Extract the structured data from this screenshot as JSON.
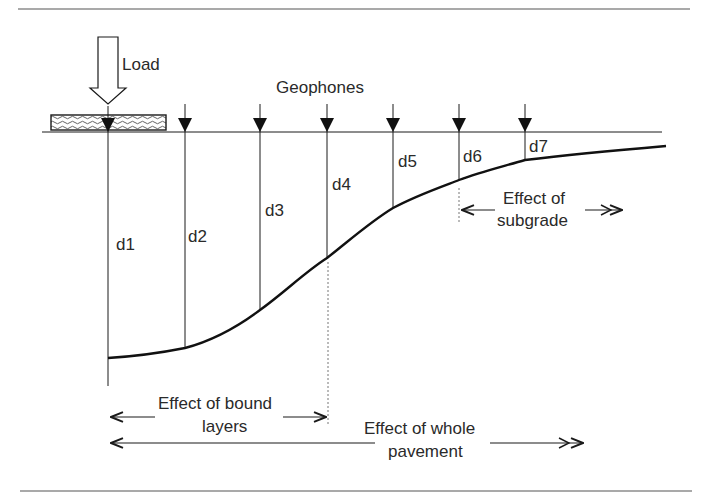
{
  "diagram": {
    "load_label": "Load",
    "geophones_label": "Geophones",
    "deflections": [
      {
        "label": "d1",
        "x": 108,
        "curve_y": 358
      },
      {
        "label": "d2",
        "x": 185,
        "curve_y": 348
      },
      {
        "label": "d3",
        "x": 260,
        "curve_y": 310
      },
      {
        "label": "d4",
        "x": 327,
        "curve_y": 258
      },
      {
        "label": "d5",
        "x": 393,
        "curve_y": 208
      },
      {
        "label": "d6",
        "x": 459,
        "curve_y": 180
      },
      {
        "label": "d7",
        "x": 525,
        "curve_y": 160
      }
    ],
    "effects": {
      "bound_line1": "Effect of bound",
      "bound_line2": "layers",
      "whole_line1": "Effect of whole",
      "whole_line2": "pavement",
      "subgrade_line1": "Effect of",
      "subgrade_line2": "subgrade"
    },
    "colors": {
      "line": "#1a1a1a",
      "rule": "#555555",
      "text": "#2a2a2a"
    }
  }
}
